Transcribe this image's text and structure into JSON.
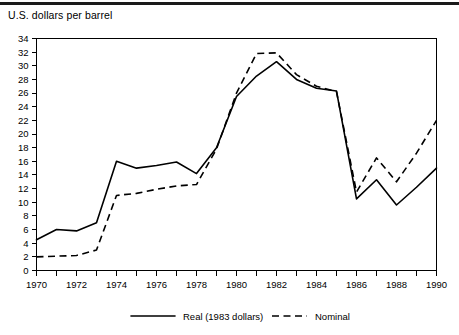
{
  "header": {
    "title": "U.S. dollars per barrel"
  },
  "legend": {
    "items": [
      {
        "label": "Real (1983 dollars)",
        "style": "solid"
      },
      {
        "label": "Nominal",
        "style": "dashed"
      }
    ]
  },
  "chart_data": {
    "type": "line",
    "title": "U.S. dollars per barrel",
    "xlabel": "",
    "ylabel": "U.S. dollars per barrel",
    "xlim": [
      1970,
      1990
    ],
    "ylim": [
      0,
      34
    ],
    "ytick_step": 2,
    "xtick_step": 2,
    "grid": false,
    "legend_position": "bottom",
    "x": [
      1970,
      1971,
      1972,
      1973,
      1974,
      1975,
      1976,
      1977,
      1978,
      1979,
      1980,
      1981,
      1982,
      1983,
      1984,
      1985,
      1986,
      1987,
      1988,
      1989,
      1990
    ],
    "xticklabels": [
      "1970",
      "1972",
      "1974",
      "1976",
      "1978",
      "1980",
      "1982",
      "1984",
      "1986",
      "1988",
      "1990"
    ],
    "yticklabels": [
      "0",
      "2",
      "4",
      "6",
      "8",
      "10",
      "12",
      "14",
      "16",
      "18",
      "20",
      "22",
      "24",
      "26",
      "28",
      "30",
      "32",
      "34"
    ],
    "series": [
      {
        "name": "Real (1983 dollars)",
        "style": "solid",
        "values": [
          4.5,
          6.0,
          5.8,
          7.0,
          16.0,
          15.0,
          15.4,
          15.9,
          14.2,
          18.0,
          25.5,
          28.5,
          30.6,
          28.0,
          26.7,
          26.3,
          10.5,
          13.3,
          9.6,
          12.2,
          15.0
        ]
      },
      {
        "name": "Nominal",
        "style": "dashed",
        "values": [
          2.0,
          2.1,
          2.2,
          3.0,
          11.0,
          11.3,
          11.9,
          12.4,
          12.6,
          17.8,
          26.0,
          31.8,
          31.9,
          28.7,
          27.0,
          26.2,
          11.5,
          16.5,
          13.0,
          17.2,
          22.0
        ]
      }
    ]
  }
}
